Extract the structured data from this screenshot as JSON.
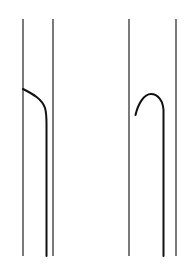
{
  "diagram": {
    "background": "#ffffff",
    "stroke_color": "#1a1a1a",
    "panels": [
      {
        "name": "left-panel",
        "walls_x": [
          23,
          53
        ],
        "wall_top_y": 19,
        "wall_bottom_y": 256,
        "curve": {
          "shape": "bend-down",
          "start": [
            23,
            89
          ],
          "end_x": 46,
          "end_y": 256
        }
      },
      {
        "name": "right-panel",
        "walls_x": [
          129,
          176
        ],
        "wall_top_y": 19,
        "wall_bottom_y": 256,
        "curve": {
          "shape": "hook-arch",
          "start": [
            135,
            115
          ],
          "peak": [
            151,
            93
          ],
          "end_x": 163,
          "end_y": 256
        }
      }
    ]
  }
}
